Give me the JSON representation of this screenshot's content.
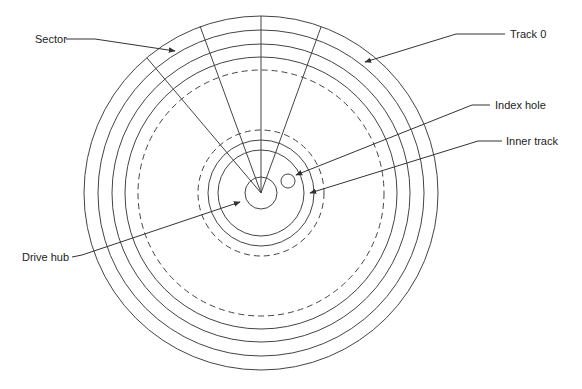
{
  "diagram": {
    "labels": {
      "sector": "Sector",
      "track0": "Track 0",
      "index_hole": "Index hole",
      "inner_track": "Inner track",
      "drive_hub": "Drive hub"
    },
    "geometry": {
      "center": [
        261,
        193
      ],
      "outer_track_radii": [
        177,
        163,
        149,
        136
      ],
      "dashed_radii": [
        123,
        63
      ],
      "inner_track_radii": [
        53,
        43
      ],
      "hub_radius": 16,
      "index_hole": {
        "cx": 288,
        "cy": 181,
        "r": 7
      }
    },
    "stroke_color": "#333333"
  }
}
